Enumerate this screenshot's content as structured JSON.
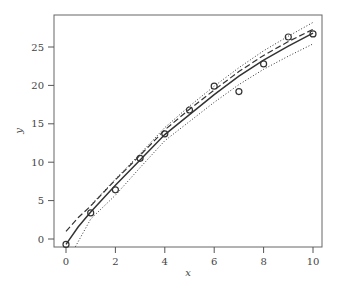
{
  "chart_data": {
    "type": "scatter",
    "title": "",
    "xlabel": "x",
    "ylabel": "y",
    "xlim": [
      -0.5,
      10.4
    ],
    "ylim": [
      -1.0,
      29.5
    ],
    "xticks": [
      0,
      2,
      4,
      6,
      8,
      10
    ],
    "yticks": [
      0,
      5,
      10,
      15,
      20,
      25
    ],
    "grid": false,
    "legend": "none",
    "points": {
      "name": "observations",
      "marker": "open-circle",
      "x": [
        0,
        1,
        2,
        3,
        4,
        5,
        6,
        7,
        8,
        9,
        10
      ],
      "y": [
        -0.7,
        3.4,
        6.4,
        10.5,
        13.7,
        16.8,
        19.9,
        19.2,
        22.8,
        26.3,
        26.7
      ]
    },
    "series": [
      {
        "name": "fit-solid",
        "style": "solid",
        "x": [
          0,
          0.5,
          1,
          2,
          3,
          4,
          5,
          6,
          7,
          8,
          9,
          10
        ],
        "y": [
          -0.7,
          1.6,
          3.5,
          7.0,
          10.3,
          13.6,
          16.2,
          18.8,
          21.2,
          23.3,
          25.1,
          26.8
        ]
      },
      {
        "name": "fit-dashed",
        "style": "dashed",
        "x": [
          0,
          0.5,
          1,
          2,
          3,
          4,
          5,
          6,
          7,
          8,
          9,
          10
        ],
        "y": [
          1.0,
          2.8,
          4.3,
          7.7,
          10.9,
          14.2,
          16.9,
          19.4,
          21.8,
          23.9,
          25.7,
          27.3
        ]
      },
      {
        "name": "upper-band-dotted",
        "style": "dotted",
        "x": [
          1,
          2,
          3,
          4,
          5,
          6,
          7,
          8,
          9,
          10
        ],
        "y": [
          4.4,
          7.8,
          11.1,
          14.5,
          17.3,
          19.9,
          22.3,
          24.5,
          26.4,
          28.2
        ]
      },
      {
        "name": "lower-band-dotted",
        "style": "dotted",
        "x": [
          0.38,
          1,
          2,
          3,
          4,
          5,
          6,
          7,
          8,
          9,
          10
        ],
        "y": [
          -1.0,
          2.6,
          5.7,
          9.3,
          12.8,
          15.3,
          17.8,
          20.1,
          22.1,
          23.8,
          25.4
        ]
      }
    ],
    "colors": {
      "axis": "#555555",
      "line": "#333333",
      "marker": "#333333"
    }
  }
}
